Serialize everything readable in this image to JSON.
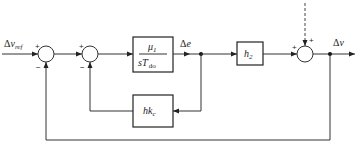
{
  "diagram": {
    "type": "control-block-diagram",
    "input_signal": {
      "delta": "Δ",
      "symbol": "v",
      "subscript": "ref"
    },
    "output_signal": {
      "delta": "Δ",
      "symbol": "v"
    },
    "intermediate_signal": {
      "delta": "Δ",
      "symbol": "e"
    },
    "blocks": [
      {
        "id": "forward-block",
        "numerator": {
          "symbol": "μ",
          "subscript": "1"
        },
        "denominator": {
          "s": "s",
          "symbol": "T",
          "prime": "'",
          "subscript": "do"
        }
      },
      {
        "id": "inner-feedback-block",
        "label": {
          "symbol": "hk",
          "subscript": "c"
        }
      },
      {
        "id": "output-gain-block",
        "label": {
          "symbol": "h",
          "subscript": "2"
        }
      }
    ],
    "summing_junctions": [
      {
        "id": "sum-1",
        "signs": {
          "left": "+",
          "bottom": "−"
        }
      },
      {
        "id": "sum-2",
        "signs": {
          "left": "+",
          "bottom": "−"
        }
      },
      {
        "id": "sum-3",
        "signs": {
          "left": "+",
          "top": "+"
        }
      }
    ],
    "colors": {
      "line": "#333333",
      "background": "#ffffff"
    }
  }
}
